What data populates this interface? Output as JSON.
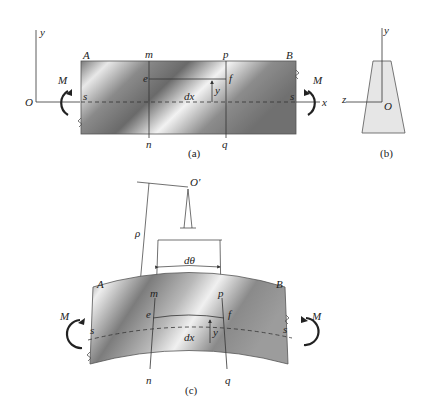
{
  "figure": {
    "panels": [
      {
        "id": "a",
        "caption": "(a)",
        "description": "Straight beam segment under pure bending moment M"
      },
      {
        "id": "b",
        "caption": "(b)",
        "description": "Trapezoidal cross-section with y and z axes through O"
      },
      {
        "id": "c",
        "caption": "(c)",
        "description": "Beam bent into arc with radius of curvature rho about center O'"
      }
    ]
  },
  "panel_a": {
    "axis_y": "y",
    "axis_x": "x",
    "origin": "O",
    "moment_left": "M",
    "moment_right": "M",
    "corner_left": "A",
    "corner_right": "B",
    "top_left_section": "m",
    "top_right_section": "p",
    "bottom_left_section": "n",
    "bottom_right_section": "q",
    "fiber_left": "e",
    "fiber_right": "f",
    "neutral_left": "s",
    "neutral_right": "s",
    "element_length": "dx",
    "distance": "y",
    "caption": "(a)"
  },
  "panel_b": {
    "axis_y": "y",
    "axis_z": "z",
    "origin": "O",
    "caption": "(b)"
  },
  "panel_c": {
    "center": "O′",
    "radius": "ρ",
    "angle": "dθ",
    "moment_left": "M",
    "moment_right": "M",
    "corner_left": "A",
    "corner_right": "B",
    "top_left_section": "m",
    "top_right_section": "p",
    "bottom_left_section": "n",
    "bottom_right_section": "q",
    "fiber_left": "e",
    "fiber_right": "f",
    "neutral_left": "s",
    "neutral_right": "s",
    "element_length": "dx",
    "distance": "y",
    "caption": "(c)"
  },
  "colors": {
    "stroke": "#333333",
    "section_fill": "#e6e6e6",
    "beam_dark": "#6e6e6e",
    "beam_light": "#f4f4f4"
  }
}
